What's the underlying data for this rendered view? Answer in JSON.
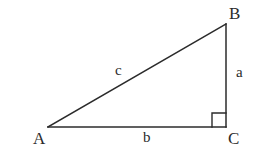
{
  "figure": {
    "kind": "right-triangle-geometry-diagram",
    "background_color": "#ffffff",
    "stroke_color": "#2b2b2b",
    "stroke_width": 1.5,
    "vertices": {
      "A": {
        "label": "A",
        "x": 48,
        "y": 127
      },
      "B": {
        "label": "B",
        "x": 226,
        "y": 24
      },
      "C": {
        "label": "C",
        "x": 226,
        "y": 127
      }
    },
    "sides": {
      "a": {
        "label": "a",
        "from": "B",
        "to": "C",
        "description": "vertical leg"
      },
      "b": {
        "label": "b",
        "from": "A",
        "to": "C",
        "description": "horizontal leg"
      },
      "c": {
        "label": "c",
        "from": "A",
        "to": "B",
        "description": "hypotenuse"
      }
    },
    "right_angle": {
      "at_vertex": "C",
      "marker": "square",
      "size": 14
    }
  }
}
